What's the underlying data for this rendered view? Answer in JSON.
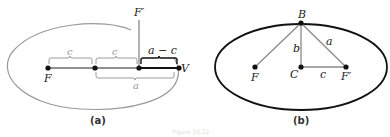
{
  "figure": {
    "caption_faint": "Figure 10.12",
    "colors": {
      "ellipse_a": "#9a9a9a",
      "ellipse_b": "#111111",
      "line": "#222222",
      "bracket_gray": "#9a9a9a",
      "bracket_dark": "#111111",
      "segment_gray": "#8a8a8a"
    }
  },
  "panel_a": {
    "caption": "(a)",
    "points": {
      "F": "F",
      "F_prime": "F′",
      "V": "V"
    },
    "braces": {
      "c1": "c",
      "c2": "c",
      "a_minus_c": "a − c",
      "a": "a"
    }
  },
  "panel_b": {
    "caption": "(b)",
    "points": {
      "B": "B",
      "F": "F",
      "C": "C",
      "F_prime": "F′"
    },
    "segments": {
      "b": "b",
      "a": "a",
      "c": "c"
    }
  }
}
